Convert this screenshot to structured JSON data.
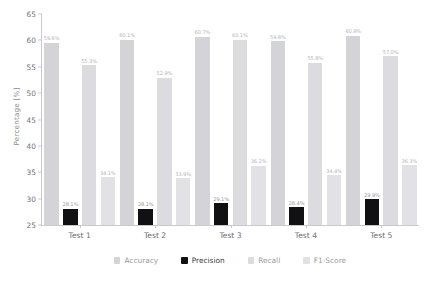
{
  "chart_data": {
    "type": "bar",
    "title": "",
    "xlabel": "",
    "ylabel": "Percentage [%]",
    "ylim": [
      25,
      65
    ],
    "yticks": [
      25,
      30,
      35,
      40,
      45,
      50,
      55,
      60,
      65
    ],
    "ytick_labels": [
      "25",
      "30",
      "35",
      "40",
      "45",
      "50",
      "55",
      "60",
      "65"
    ],
    "grid": false,
    "legend_position": "bottom",
    "value_label_suffix": "%",
    "categories": [
      "Test 1",
      "Test 2",
      "Test 3",
      "Test 4",
      "Test 5"
    ],
    "series": [
      {
        "name": "Accuracy",
        "color": "#d4d4d8",
        "values": [
          59.6,
          60.1,
          60.7,
          59.8,
          60.9
        ],
        "labels": [
          "59.6%",
          "60.1%",
          "60.7%",
          "59.8%",
          "60.9%"
        ]
      },
      {
        "name": "Precision",
        "color": "#111114",
        "values": [
          28.1,
          28.1,
          29.1,
          28.4,
          29.9
        ],
        "labels": [
          "28.1%",
          "28.1%",
          "29.1%",
          "28.4%",
          "29.9%"
        ]
      },
      {
        "name": "Recall",
        "color": "#dcdce0",
        "values": [
          55.3,
          52.9,
          60.1,
          55.8,
          57.0
        ],
        "labels": [
          "55.3%",
          "52.9%",
          "60.1%",
          "55.8%",
          "57.0%"
        ]
      },
      {
        "name": "F1-Score",
        "color": "#e2e2e6",
        "values": [
          34.1,
          33.9,
          36.2,
          34.4,
          36.3
        ],
        "labels": [
          "34.1%",
          "33.9%",
          "36.2%",
          "34.4%",
          "36.3%"
        ]
      }
    ]
  },
  "axis": {
    "y_title": "Percentage [%]"
  },
  "colors": {
    "axis": "#c9c9ce",
    "tick_text": "#76767c",
    "background": "#ffffff"
  }
}
